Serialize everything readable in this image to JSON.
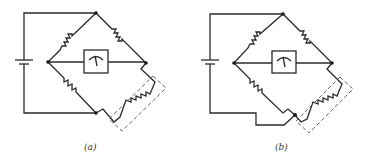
{
  "figure": {
    "panels": [
      {
        "id": "a",
        "label": "(a)",
        "description": "Wheatstone bridge with strain gauge in lower-right arm, two-wire connection"
      },
      {
        "id": "b",
        "label": "(b)",
        "description": "Wheatstone bridge with strain gauge, three-wire (lead-compensated) connection"
      }
    ],
    "components": [
      "battery",
      "resistor",
      "resistor",
      "resistor",
      "galvanometer",
      "strain-gauge"
    ],
    "colors": {
      "line": "#2a2a2a",
      "background": "#ffffff"
    }
  }
}
